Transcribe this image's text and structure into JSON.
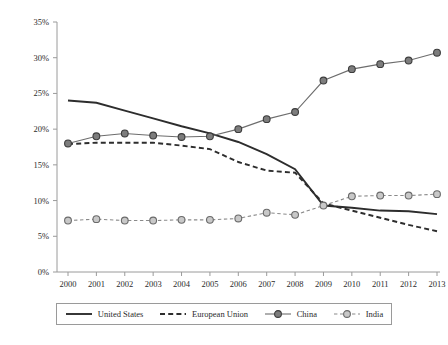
{
  "chart_data": {
    "type": "line",
    "title": "",
    "subtitle": "",
    "xlabel": "",
    "ylabel": "",
    "categories": [
      "2000",
      "2001",
      "2002",
      "2003",
      "2004",
      "2005",
      "2006",
      "2007",
      "2008",
      "2009",
      "2010",
      "2011",
      "2012",
      "2013"
    ],
    "x": [
      2000,
      2001,
      2002,
      2003,
      2004,
      2005,
      2006,
      2007,
      2008,
      2009,
      2010,
      2011,
      2012,
      2013
    ],
    "ylim": [
      0,
      35
    ],
    "ytick_values": [
      0,
      5,
      10,
      15,
      20,
      25,
      30,
      35
    ],
    "ytick_labels": [
      "0%",
      "5%",
      "10%",
      "15%",
      "20%",
      "25%",
      "30%",
      "35%"
    ],
    "grid": false,
    "legend_position": "bottom",
    "series": [
      {
        "name": "United States",
        "style": "solid",
        "marker": "none",
        "color": "#2d2d2d",
        "values": [
          24.0,
          23.7,
          22.6,
          21.5,
          20.4,
          19.4,
          18.2,
          16.5,
          14.4,
          9.3,
          9.0,
          8.6,
          8.5,
          8.1
        ]
      },
      {
        "name": "European Union",
        "style": "dashed",
        "marker": "none",
        "color": "#2d2d2d",
        "values": [
          17.9,
          18.1,
          18.1,
          18.1,
          17.7,
          17.2,
          15.4,
          14.2,
          13.9,
          9.6,
          8.6,
          7.6,
          6.6,
          5.7
        ]
      },
      {
        "name": "China",
        "style": "solid",
        "marker": "circle-dark",
        "color": "#6d6d6d",
        "values": [
          18.0,
          19.0,
          19.4,
          19.1,
          18.9,
          19.0,
          20.0,
          21.4,
          22.4,
          26.8,
          28.4,
          29.1,
          29.6,
          30.7
        ]
      },
      {
        "name": "India",
        "style": "dashed",
        "marker": "circle-light",
        "color": "#8a8a8a",
        "values": [
          7.2,
          7.4,
          7.2,
          7.2,
          7.3,
          7.3,
          7.5,
          8.3,
          8.0,
          9.3,
          10.6,
          10.7,
          10.7,
          10.9
        ]
      }
    ]
  },
  "axis": {
    "x_tick_labels": [
      "2000",
      "2001",
      "2002",
      "2003",
      "2004",
      "2005",
      "2006",
      "2007",
      "2008",
      "2009",
      "2010",
      "2011",
      "2012",
      "2013"
    ],
    "y_tick_labels": [
      "35%",
      "30%",
      "25%",
      "20%",
      "15%",
      "10%",
      "5%",
      "0%"
    ]
  },
  "legend": {
    "items": [
      {
        "label": "United States",
        "icon": "solid-line-swatch"
      },
      {
        "label": "European Union",
        "icon": "dashed-line-swatch"
      },
      {
        "label": "China",
        "icon": "marker-line-dark-swatch"
      },
      {
        "label": "India",
        "icon": "marker-line-light-swatch"
      }
    ]
  }
}
